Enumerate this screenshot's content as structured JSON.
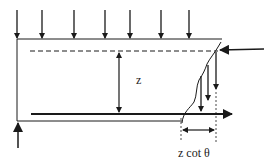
{
  "diagram": {
    "labels": {
      "depth": "z",
      "horizontal_projection": "z cot θ"
    },
    "colors": {
      "stroke": "#1a1a1a",
      "background": "#ffffff"
    },
    "load_arrows_count": 7
  }
}
